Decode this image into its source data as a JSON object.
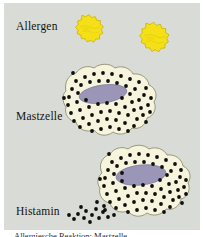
{
  "figure": {
    "background_color": "#ffffff",
    "panel_color": "#d9dcd6"
  },
  "labels": {
    "allergen": "Allergen",
    "mastzelle": "Mastzelle",
    "histamin": "Histamin"
  },
  "caption": {
    "text": "Allergiesche Reaktion: Mastzelle"
  },
  "colors": {
    "allergen_fill": "#f5e017",
    "allergen_stroke": "#c9b400",
    "cell_fill": "#f7f4de",
    "cell_stroke": "#8f8d6f",
    "nucleus_fill": "#9b96b8",
    "nucleus_stroke": "#7c7798",
    "granule_fill": "#100e0c",
    "label_color": "#14110e"
  },
  "allergens": [
    {
      "name": "allergen-particle-1",
      "cx": 82,
      "cy": 30,
      "r": 17,
      "bumps": 13
    },
    {
      "name": "allergen-particle-2",
      "cx": 146,
      "cy": 39,
      "r": 19,
      "bumps": 14
    }
  ],
  "mast_cells": [
    {
      "name": "mast-cell-intact",
      "state": "intact",
      "nucleus": {
        "cx": 99,
        "cy": 91,
        "rx": 24,
        "ry": 9,
        "rotation": -8
      },
      "granule_count": 88,
      "degranulating": false
    },
    {
      "name": "mast-cell-degranulating",
      "state": "degranulating",
      "nucleus": {
        "cx": 137,
        "cy": 172,
        "rx": 25,
        "ry": 10,
        "rotation": -6
      },
      "granule_count": 92,
      "degranulating": true
    }
  ],
  "histamine_release": {
    "name": "histamine-granules",
    "granule_count": 14,
    "direction": "lower-left"
  }
}
